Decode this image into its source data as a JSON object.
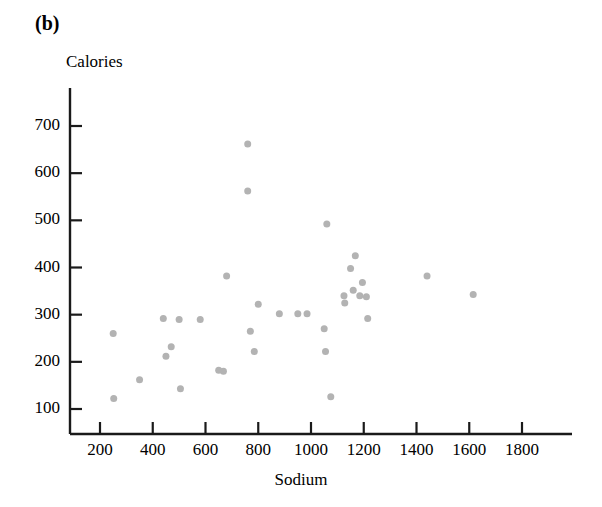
{
  "figure": {
    "panel_label": "(b)",
    "y_axis_title": "Calories",
    "x_axis_title": "Sodium",
    "point_color": "#b3b3b3",
    "axis_color": "#1a1a1a",
    "background_color": "#ffffff"
  },
  "chart_data": {
    "type": "scatter",
    "title": "(b)",
    "xlabel": "Sodium",
    "ylabel": "Calories",
    "xlim": [
      70,
      1900
    ],
    "ylim": [
      30,
      760
    ],
    "grid": false,
    "legend": null,
    "xticks": [
      200,
      400,
      600,
      800,
      1000,
      1200,
      1400,
      1600,
      1800
    ],
    "xtick_labels": [
      "200",
      "400",
      "600",
      "800",
      "1000",
      "1200",
      "1400",
      "1600",
      "1800"
    ],
    "yticks": [
      100,
      200,
      300,
      400,
      500,
      600,
      700
    ],
    "ytick_labels": [
      "100",
      "200",
      "300",
      "400",
      "500",
      "600",
      "700"
    ],
    "marker": "circle",
    "marker_size": 7,
    "points": [
      {
        "x": 250,
        "y": 260
      },
      {
        "x": 252,
        "y": 122
      },
      {
        "x": 350,
        "y": 162
      },
      {
        "x": 440,
        "y": 292
      },
      {
        "x": 450,
        "y": 212
      },
      {
        "x": 470,
        "y": 232
      },
      {
        "x": 500,
        "y": 290
      },
      {
        "x": 505,
        "y": 143
      },
      {
        "x": 580,
        "y": 290
      },
      {
        "x": 650,
        "y": 182
      },
      {
        "x": 668,
        "y": 180
      },
      {
        "x": 680,
        "y": 382
      },
      {
        "x": 760,
        "y": 662
      },
      {
        "x": 760,
        "y": 562
      },
      {
        "x": 770,
        "y": 265
      },
      {
        "x": 785,
        "y": 222
      },
      {
        "x": 800,
        "y": 322
      },
      {
        "x": 880,
        "y": 302
      },
      {
        "x": 950,
        "y": 302
      },
      {
        "x": 985,
        "y": 302
      },
      {
        "x": 1050,
        "y": 270
      },
      {
        "x": 1055,
        "y": 222
      },
      {
        "x": 1060,
        "y": 492
      },
      {
        "x": 1075,
        "y": 126
      },
      {
        "x": 1125,
        "y": 340
      },
      {
        "x": 1128,
        "y": 325
      },
      {
        "x": 1150,
        "y": 398
      },
      {
        "x": 1160,
        "y": 352
      },
      {
        "x": 1168,
        "y": 425
      },
      {
        "x": 1185,
        "y": 340
      },
      {
        "x": 1195,
        "y": 368
      },
      {
        "x": 1210,
        "y": 338
      },
      {
        "x": 1215,
        "y": 292
      },
      {
        "x": 1440,
        "y": 382
      },
      {
        "x": 1615,
        "y": 343
      }
    ]
  }
}
